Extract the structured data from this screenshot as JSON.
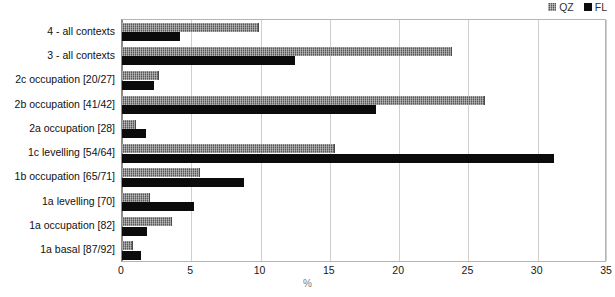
{
  "chart_data": {
    "type": "bar",
    "orientation": "horizontal",
    "title": "",
    "xlabel": "%",
    "ylabel": "",
    "xlim": [
      0,
      35
    ],
    "xticks": [
      0,
      5,
      10,
      15,
      20,
      25,
      30,
      35
    ],
    "grid": true,
    "legend_position": "top-right",
    "categories": [
      "4 - all contexts",
      "3 - all contexts",
      "2c occupation [20/27]",
      "2b occupation [41/42]",
      "2a occupation [28]",
      "1c levelling [54/64]",
      "1b occupation [65/71]",
      "1a levelling [70]",
      "1a occupation [82]",
      "1a basal [87/92]"
    ],
    "series": [
      {
        "name": "QZ",
        "color": "#575757",
        "pattern": "crosshatch",
        "values": [
          9.9,
          23.8,
          2.7,
          26.2,
          1.0,
          15.4,
          5.6,
          2.0,
          3.6,
          0.8
        ]
      },
      {
        "name": "FL",
        "color": "#0b0b0b",
        "pattern": "solid",
        "values": [
          4.2,
          12.5,
          2.3,
          18.3,
          1.7,
          31.2,
          8.8,
          5.2,
          1.8,
          1.4
        ]
      }
    ]
  },
  "legend": {
    "entries": [
      {
        "label": "QZ",
        "icon": "square-swatch-hatched"
      },
      {
        "label": "FL",
        "icon": "square-swatch-solid"
      }
    ]
  }
}
